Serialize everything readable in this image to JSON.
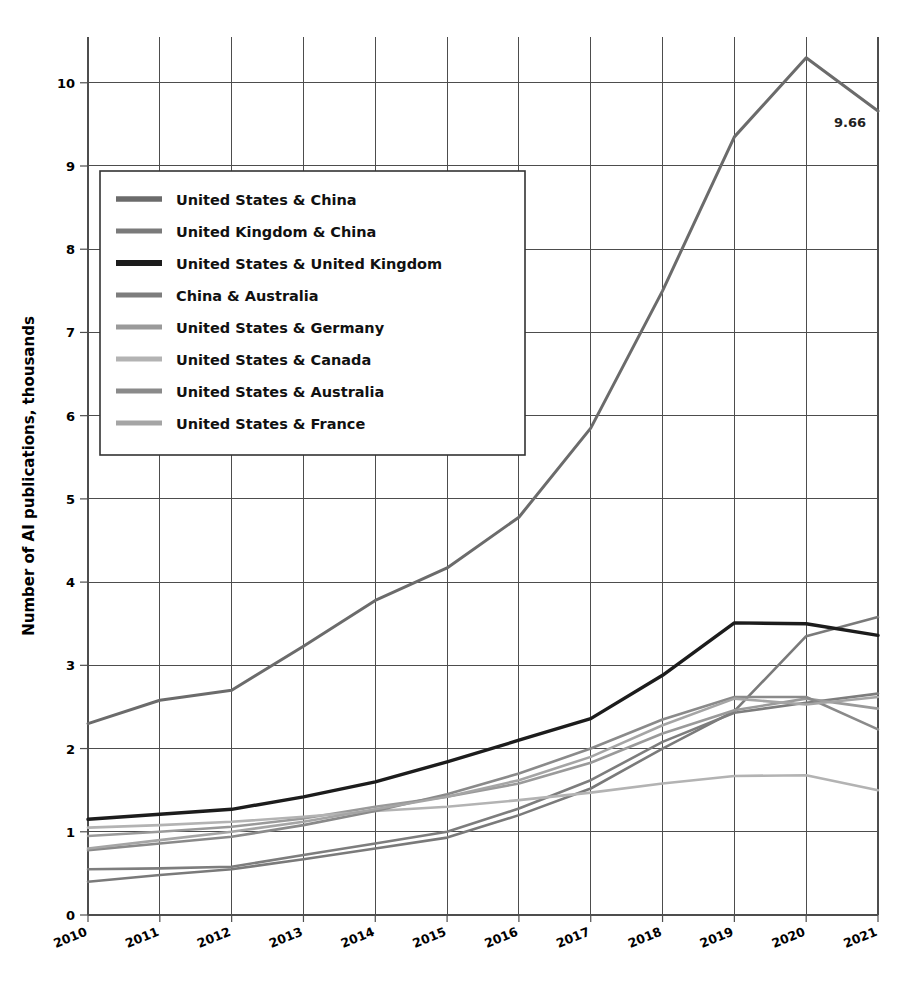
{
  "chart_data": {
    "type": "line",
    "title": "",
    "subtitle": "",
    "xlabel": "",
    "ylabel": "Number of AI publications, thousands",
    "x": [
      2010,
      2011,
      2012,
      2013,
      2014,
      2015,
      2016,
      2017,
      2018,
      2019,
      2020,
      2021
    ],
    "xtick_labels": [
      "2010",
      "2011",
      "2012",
      "2013",
      "2014",
      "2015",
      "2016",
      "2017",
      "2018",
      "2019",
      "2020",
      "2021"
    ],
    "ytick_labels": [
      "0",
      "1",
      "2",
      "3",
      "4",
      "5",
      "6",
      "7",
      "8",
      "9",
      "10"
    ],
    "ylim": [
      0,
      10.55
    ],
    "xlim": [
      2010,
      2021
    ],
    "grid": true,
    "legend_position": "upper-left-inside",
    "annotations": [
      {
        "text": "9.66",
        "x": 2021,
        "y": 9.66,
        "series": "United States & China"
      }
    ],
    "series": [
      {
        "name": "United States & China",
        "color": "#6b6b6b",
        "width": 3.0,
        "values": [
          2.3,
          2.58,
          2.7,
          3.23,
          3.78,
          4.17,
          4.78,
          5.85,
          7.5,
          9.35,
          10.3,
          9.66
        ]
      },
      {
        "name": "United Kingdom & China",
        "color": "#7a7a7a",
        "width": 2.6,
        "values": [
          0.4,
          0.48,
          0.55,
          0.67,
          0.8,
          0.93,
          1.2,
          1.52,
          2.0,
          2.45,
          3.35,
          3.58
        ]
      },
      {
        "name": "United States & United Kingdom",
        "color": "#1c1c1c",
        "width": 3.4,
        "values": [
          1.15,
          1.21,
          1.27,
          1.42,
          1.6,
          1.84,
          2.1,
          2.36,
          2.88,
          3.51,
          3.5,
          3.36
        ]
      },
      {
        "name": "China & Australia",
        "color": "#7d7d7d",
        "width": 2.6,
        "values": [
          0.55,
          0.56,
          0.58,
          0.72,
          0.86,
          1.0,
          1.28,
          1.62,
          2.08,
          2.43,
          2.55,
          2.66
        ]
      },
      {
        "name": "United States & Germany",
        "color": "#9a9a9a",
        "width": 2.6,
        "values": [
          0.95,
          1.0,
          1.06,
          1.16,
          1.3,
          1.42,
          1.58,
          1.83,
          2.18,
          2.46,
          2.6,
          2.48
        ]
      },
      {
        "name": "United States & Canada",
        "color": "#b3b3b3",
        "width": 2.6,
        "values": [
          1.05,
          1.08,
          1.12,
          1.18,
          1.25,
          1.3,
          1.38,
          1.47,
          1.58,
          1.67,
          1.68,
          1.5
        ]
      },
      {
        "name": "United States & Australia",
        "color": "#8a8a8a",
        "width": 2.6,
        "values": [
          0.78,
          0.86,
          0.94,
          1.08,
          1.25,
          1.45,
          1.7,
          2.0,
          2.35,
          2.62,
          2.62,
          2.23
        ]
      },
      {
        "name": "United States & France",
        "color": "#a5a5a5",
        "width": 2.6,
        "values": [
          0.8,
          0.9,
          1.0,
          1.12,
          1.27,
          1.42,
          1.62,
          1.9,
          2.28,
          2.6,
          2.53,
          2.62
        ]
      }
    ]
  },
  "legend": {
    "items": [
      {
        "label": "United States & China"
      },
      {
        "label": "United Kingdom & China"
      },
      {
        "label": "United States & United Kingdom"
      },
      {
        "label": "China & Australia"
      },
      {
        "label": "United States & Germany"
      },
      {
        "label": "United States & Canada"
      },
      {
        "label": "United States & Australia"
      },
      {
        "label": "United States & France"
      }
    ]
  }
}
